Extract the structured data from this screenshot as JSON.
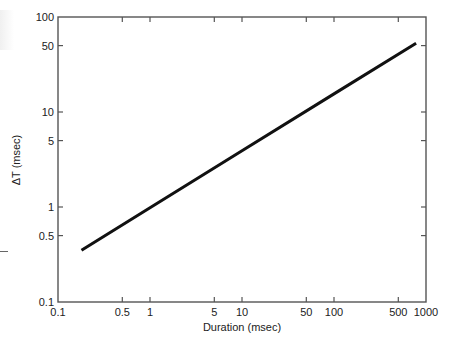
{
  "chart_data": {
    "type": "line",
    "title": "",
    "xlabel": "Duration (msec)",
    "ylabel": "ΔT (msec)",
    "xscale": "log",
    "yscale": "log",
    "xlim": [
      0.1,
      1000
    ],
    "ylim": [
      0.1,
      100
    ],
    "xticks": [
      0.1,
      0.5,
      1,
      5,
      10,
      50,
      100,
      500,
      1000
    ],
    "xtick_labels": [
      "0.1",
      "0.5",
      "1",
      "5",
      "10",
      "50",
      "100",
      "500",
      "1000"
    ],
    "yticks": [
      0.1,
      0.5,
      1,
      5,
      10,
      50,
      100
    ],
    "ytick_labels": [
      "0.1",
      "0.5",
      "1",
      "5",
      "10",
      "50",
      "100"
    ],
    "grid": false,
    "mirror_ticks": true,
    "series": [
      {
        "name": "ΔT vs duration",
        "color": "#111111",
        "x": [
          0.18,
          1,
          10,
          100,
          780
        ],
        "y": [
          0.35,
          0.98,
          3.9,
          15.5,
          53
        ]
      }
    ]
  }
}
